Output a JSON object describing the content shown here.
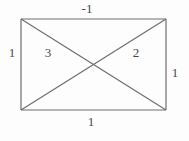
{
  "figure": {
    "type": "geometry-diagram",
    "shape": "rectangle-with-both-diagonals",
    "background_color": "#fdfdfd",
    "line_color": "#6e6e6e",
    "text_color": "#4a4a4a",
    "rectangle": {
      "left": 21,
      "top": 19,
      "right": 166,
      "bottom": 110,
      "width": 145,
      "height": 91
    },
    "diagonal_intersection": {
      "x": 93.5,
      "y": 64.5
    },
    "edge_labels": {
      "top": "-1",
      "left": "1",
      "right": "1",
      "bottom": "1"
    },
    "interior_labels": {
      "left_region": "3",
      "right_region": "2"
    },
    "labels": [
      {
        "name": "top-edge-label",
        "text": "-1",
        "x": 87,
        "y": 8
      },
      {
        "name": "left-edge-label",
        "text": "1",
        "x": 12,
        "y": 52
      },
      {
        "name": "right-edge-label",
        "text": "1",
        "x": 175,
        "y": 72
      },
      {
        "name": "bottom-edge-label",
        "text": "1",
        "x": 91,
        "y": 121
      },
      {
        "name": "left-region-label",
        "text": "3",
        "x": 48,
        "y": 52
      },
      {
        "name": "right-region-label",
        "text": "2",
        "x": 136,
        "y": 52
      }
    ]
  }
}
